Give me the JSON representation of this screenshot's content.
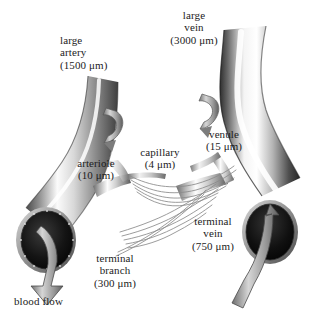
{
  "figure": {
    "background_color": "#ffffff",
    "text_color": "#1c1c1c",
    "width": 310,
    "height": 321
  },
  "labels": {
    "large_artery": "large\nartery\n(1500 μm)",
    "large_vein": "large\nvein\n(3000 μm)",
    "arteriole": "arteriole\n(10 μm)",
    "capillary": "capillary\n(4 μm)",
    "venule": "venule\n(15 μm)",
    "terminal_vein": "terminal\nvein\n(750 μm)",
    "terminal_branch": "terminal\nbranch\n(300 μm)",
    "blood_flow": "blood flow"
  },
  "vessels": [
    {
      "name": "large artery",
      "diameter_um": 1500,
      "side": "arterial"
    },
    {
      "name": "terminal branch",
      "diameter_um": 300,
      "side": "arterial"
    },
    {
      "name": "arteriole",
      "diameter_um": 10,
      "side": "arterial"
    },
    {
      "name": "capillary",
      "diameter_um": 4,
      "side": "exchange"
    },
    {
      "name": "venule",
      "diameter_um": 15,
      "side": "venous"
    },
    {
      "name": "terminal vein",
      "diameter_um": 750,
      "side": "venous"
    },
    {
      "name": "large vein",
      "diameter_um": 3000,
      "side": "venous"
    }
  ],
  "flow_arrows": [
    {
      "name": "arterial-outflow-arrow",
      "direction": "down-out",
      "location": "left vessel opening"
    },
    {
      "name": "venous-inflow-arrow",
      "direction": "up-in",
      "location": "right vessel opening"
    },
    {
      "name": "arteriole-flow-arrow",
      "direction": "curved",
      "location": "center-left"
    },
    {
      "name": "venule-flow-arrow",
      "direction": "curved",
      "location": "center-right"
    }
  ]
}
